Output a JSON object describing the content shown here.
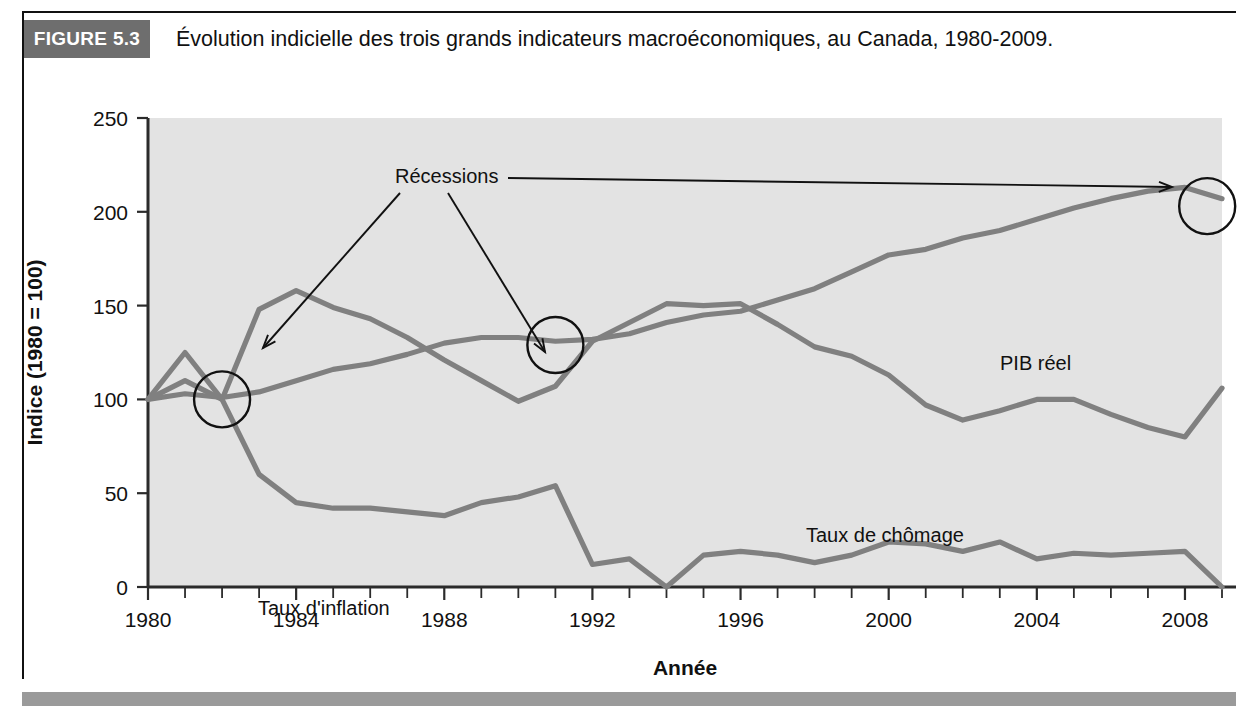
{
  "figure": {
    "badge_label": "FIGURE 5.3",
    "title": "Évolution indicielle des trois grands indicateurs macroéconomiques, au Canada, 1980-2009.",
    "badge_color": "#6e6e6e",
    "plot_background": "#e3e3e3",
    "series_color": "#808080",
    "ink_color": "#111111"
  },
  "annotations": {
    "recessions_label": "Récessions",
    "circles": [
      {
        "year": 1982,
        "value": 100
      },
      {
        "year": 1991,
        "value": 129
      },
      {
        "year": 2008.6,
        "value": 203
      }
    ]
  },
  "chart_data": {
    "type": "line",
    "title": "Évolution indicielle des trois grands indicateurs macroéconomiques, au Canada, 1980-2009.",
    "xlabel": "Année",
    "ylabel": "Indice (1980 = 100)",
    "xlim": [
      1980,
      2009
    ],
    "ylim": [
      0,
      250
    ],
    "yticks": [
      0,
      50,
      100,
      150,
      200,
      250
    ],
    "xticks": [
      1980,
      1984,
      1988,
      1992,
      1996,
      2000,
      2004,
      2008
    ],
    "xtick_minor_step": 1,
    "grid": false,
    "legend": "inline-labels",
    "x": [
      1980,
      1981,
      1982,
      1983,
      1984,
      1985,
      1986,
      1987,
      1988,
      1989,
      1990,
      1991,
      1992,
      1993,
      1994,
      1995,
      1996,
      1997,
      1998,
      1999,
      2000,
      2001,
      2002,
      2003,
      2004,
      2005,
      2006,
      2007,
      2008,
      2009
    ],
    "series": [
      {
        "name": "PIB réel",
        "label": "PIB réel",
        "values": [
          100,
          103,
          101,
          104,
          110,
          116,
          119,
          124,
          130,
          133,
          133,
          131,
          132,
          135,
          141,
          145,
          147,
          153,
          159,
          168,
          177,
          180,
          186,
          190,
          196,
          202,
          207,
          211,
          213,
          207
        ]
      },
      {
        "name": "Taux de chômage",
        "label": "Taux de chômage",
        "values": [
          100,
          125,
          100,
          148,
          158,
          149,
          143,
          133,
          121,
          110,
          99,
          107,
          131,
          141,
          151,
          150,
          151,
          140,
          128,
          123,
          113,
          97,
          89,
          94,
          100,
          100,
          92,
          85,
          80,
          106
        ]
      },
      {
        "name": "Taux d'inflation",
        "label": "Taux d'inflation",
        "values": [
          100,
          110,
          100,
          60,
          45,
          42,
          42,
          40,
          38,
          45,
          48,
          54,
          12,
          15,
          0,
          17,
          19,
          17,
          13,
          17,
          24,
          23,
          19,
          24,
          15,
          18,
          17,
          18,
          19,
          0
        ]
      }
    ]
  }
}
